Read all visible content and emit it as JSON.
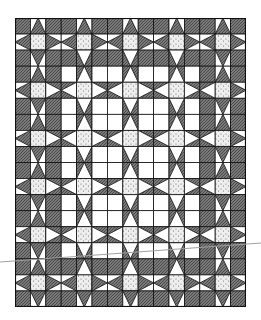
{
  "image": {
    "subject": "quilt-pattern-illustration",
    "description": "Star quilt pattern drawing: eight-point stars with speckled centers on a grid, dark hatched outer border and white interior"
  },
  "quilt": {
    "cols": 15,
    "rows": 18,
    "block_size_cells": 3,
    "star_cols": 5,
    "star_rows": 6,
    "interior": {
      "col_start": 3,
      "col_end": 11,
      "row_start": 3,
      "row_end": 14
    },
    "colors": {
      "dark": "#6e6e6e",
      "light": "#ffffff",
      "center": "#e8e8e8",
      "line": "#111111",
      "scratch": "#9a9a9a"
    }
  }
}
